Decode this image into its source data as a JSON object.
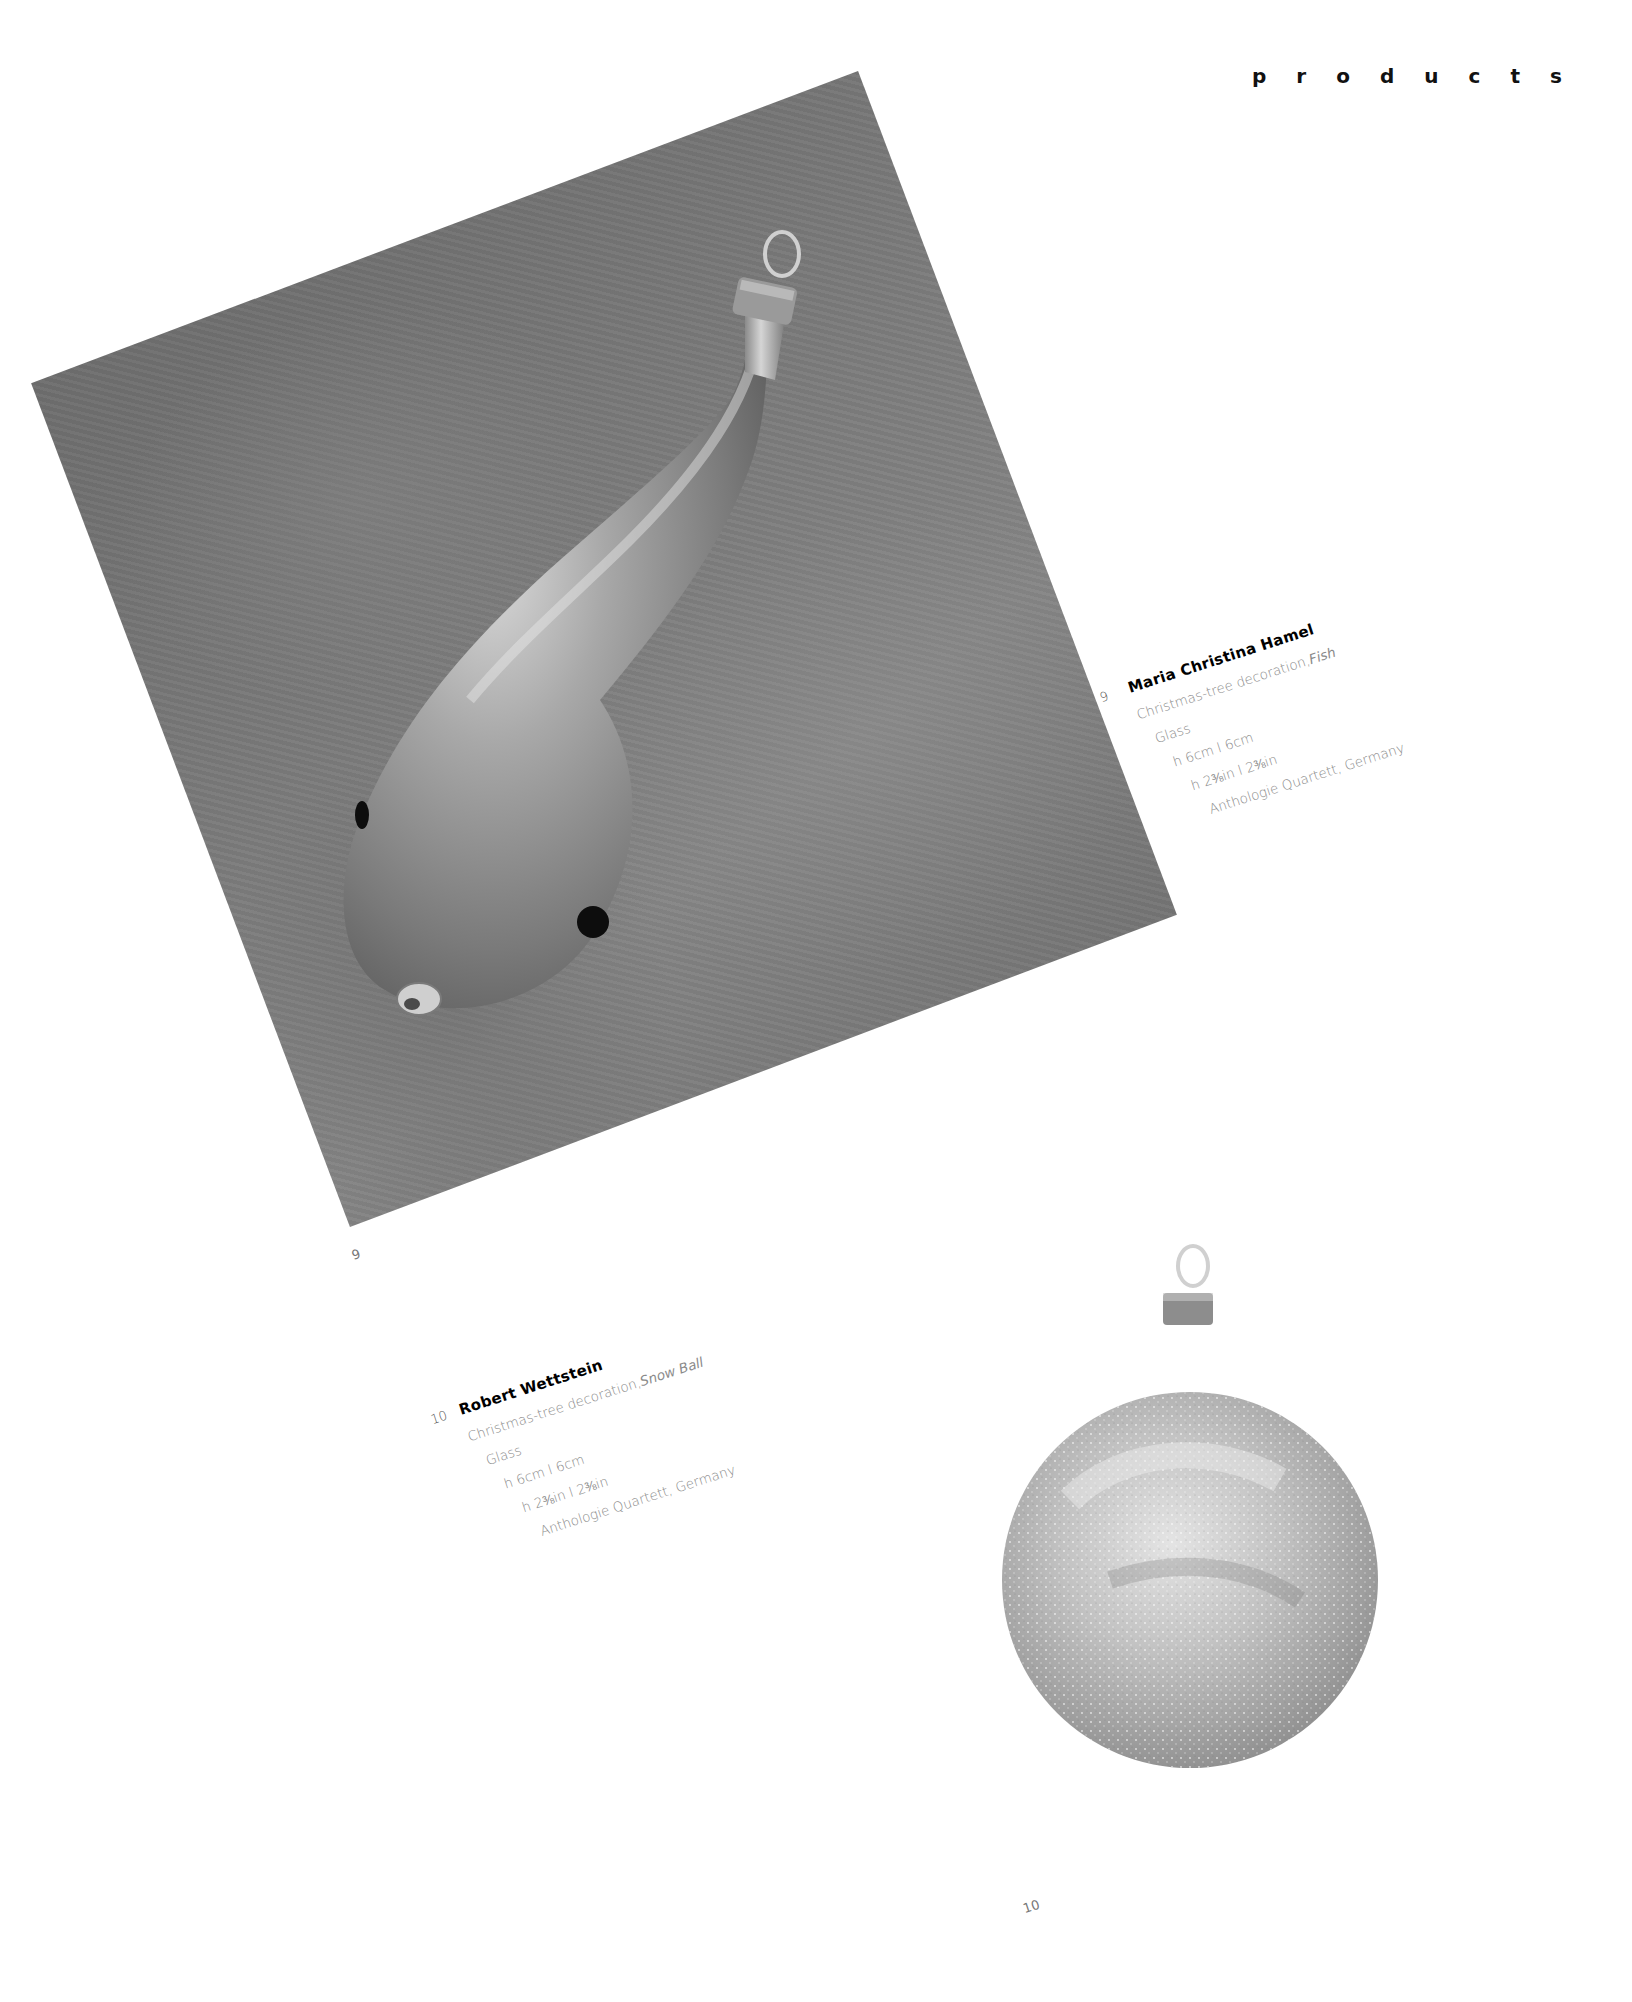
{
  "header": {
    "section_letters": [
      "p",
      "r",
      "o",
      "d",
      "u",
      "c",
      "t",
      "s"
    ],
    "section_title": "products"
  },
  "items": [
    {
      "number": "9",
      "designer": "Maria Christina Hamel",
      "description_prefix": "Christmas-tree decoration, ",
      "description_name": "Fish",
      "material": "Glass",
      "dimensions_cm": "h 6cm  l 6cm",
      "dimensions_in": "h 2⅜in  l 2⅜in",
      "manufacturer": "Anthologie Quartett, Germany",
      "photo_label": "9",
      "photo_subject": "matte silver teardrop-shaped fish ornament with black dot eyes and metal cap"
    },
    {
      "number": "10",
      "designer": "Robert Wettstein",
      "description_prefix": "Christmas-tree decoration, ",
      "description_name": "Snow Ball",
      "material": "Glass",
      "dimensions_cm": "h 6cm  l 6cm",
      "dimensions_in": "h 2⅜in  l 2⅜in",
      "manufacturer": "Anthologie Quartett, Germany",
      "photo_label": "10",
      "photo_subject": "glittered frosted glass ball ornament with metal cap and hanging loop"
    }
  ],
  "colors": {
    "page_background": "#ffffff",
    "photo_1_background": "#7b7b7b",
    "photo_2_background": "#979797",
    "heading_text": "#111111",
    "caption_text": "#8a8a8a"
  }
}
